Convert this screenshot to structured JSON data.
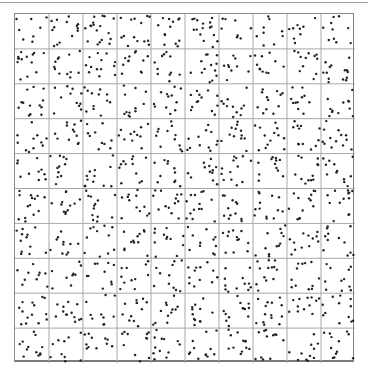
{
  "chart_data": {
    "type": "scatter",
    "title": "",
    "xlabel": "",
    "ylabel": "",
    "grid": {
      "on": true,
      "rows": 10,
      "cols": 10,
      "color": "#a8a8a8"
    },
    "xlim": [
      0,
      10
    ],
    "ylim": [
      0,
      10
    ],
    "point_color": "#222222",
    "point_radius": 1.2,
    "approx_points_per_cell": 12,
    "approx_total_points": 1200,
    "distribution": "uniform random (pseudo-random placement within each grid cell)",
    "cell_counts": [
      [
        8,
        14,
        18,
        14,
        13,
        16,
        8,
        9,
        9,
        10
      ],
      [
        14,
        12,
        13,
        12,
        11,
        13,
        10,
        11,
        12,
        14
      ],
      [
        13,
        11,
        12,
        12,
        12,
        13,
        11,
        12,
        11,
        12
      ],
      [
        11,
        12,
        10,
        11,
        12,
        12,
        12,
        13,
        12,
        13
      ],
      [
        10,
        11,
        12,
        12,
        11,
        12,
        13,
        12,
        12,
        12
      ],
      [
        14,
        12,
        13,
        12,
        13,
        14,
        12,
        13,
        13,
        13
      ],
      [
        12,
        11,
        11,
        12,
        12,
        11,
        12,
        12,
        12,
        12
      ],
      [
        10,
        9,
        10,
        11,
        11,
        12,
        12,
        13,
        12,
        11
      ],
      [
        14,
        13,
        10,
        12,
        12,
        12,
        13,
        14,
        12,
        12
      ],
      [
        12,
        10,
        11,
        11,
        12,
        12,
        12,
        12,
        11,
        12
      ]
    ],
    "seed": 7
  }
}
